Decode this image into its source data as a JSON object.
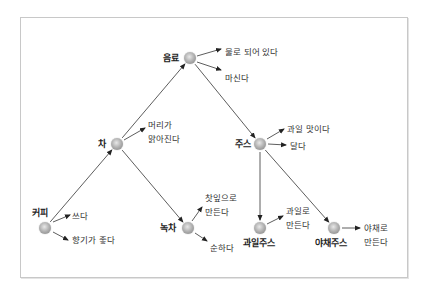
{
  "diagram": {
    "type": "concept-hierarchy",
    "nodes": [
      {
        "id": "beverage",
        "label": "음료",
        "x": 190,
        "y": 58,
        "label_x": 163,
        "label_y": 53
      },
      {
        "id": "tea",
        "label": "차",
        "x": 117,
        "y": 144,
        "label_x": 98,
        "label_y": 139
      },
      {
        "id": "coffee",
        "label": "커피",
        "x": 45,
        "y": 228,
        "label_x": 32,
        "label_y": 208
      },
      {
        "id": "green_tea",
        "label": "녹차",
        "x": 188,
        "y": 228,
        "label_x": 160,
        "label_y": 223
      },
      {
        "id": "juice",
        "label": "주스",
        "x": 260,
        "y": 144,
        "label_x": 235,
        "label_y": 139
      },
      {
        "id": "fruit_juice",
        "label": "과일주스",
        "x": 260,
        "y": 228,
        "label_x": 243,
        "label_y": 238
      },
      {
        "id": "veg_juice",
        "label": "야채주스",
        "x": 334,
        "y": 228,
        "label_x": 315,
        "label_y": 238
      }
    ],
    "edges": [
      {
        "from": "coffee",
        "to": "tea"
      },
      {
        "from": "tea",
        "to": "beverage"
      },
      {
        "from": "beverage",
        "to": "juice"
      },
      {
        "from": "tea",
        "to": "green_tea"
      },
      {
        "from": "juice",
        "to": "fruit_juice"
      },
      {
        "from": "juice",
        "to": "veg_juice"
      }
    ],
    "attributes": [
      {
        "node": "beverage",
        "text": "물로 되어 있다",
        "x": 225,
        "y": 45,
        "ax1": 197,
        "ay1": 56,
        "ax2": 221,
        "ay2": 49
      },
      {
        "node": "beverage",
        "text": "마신다",
        "x": 225,
        "y": 71,
        "ax1": 197,
        "ay1": 62,
        "ax2": 221,
        "ay2": 70
      },
      {
        "node": "tea",
        "text": "머리가\n맑아진다",
        "x": 148,
        "y": 118,
        "ax1": 124,
        "ay1": 140,
        "ax2": 145,
        "ay2": 128
      },
      {
        "node": "coffee",
        "text": "쓰다",
        "x": 72,
        "y": 209,
        "ax1": 53,
        "ay1": 222,
        "ax2": 70,
        "ay2": 215
      },
      {
        "node": "coffee",
        "text": "향기가 좋다",
        "x": 72,
        "y": 233,
        "ax1": 53,
        "ay1": 232,
        "ax2": 68,
        "ay2": 240
      },
      {
        "node": "green_tea",
        "text": "찻잎으로\n만든다",
        "x": 205,
        "y": 191,
        "ax1": 192,
        "ay1": 221,
        "ax2": 202,
        "ay2": 207
      },
      {
        "node": "green_tea",
        "text": "순하다",
        "x": 210,
        "y": 241,
        "ax1": 195,
        "ay1": 233,
        "ax2": 207,
        "ay2": 241
      },
      {
        "node": "juice",
        "text": "과일 맛이다",
        "x": 287,
        "y": 122,
        "ax1": 267,
        "ay1": 139,
        "ax2": 284,
        "ay2": 129
      },
      {
        "node": "juice",
        "text": "달다",
        "x": 290,
        "y": 139,
        "ax1": 268,
        "ay1": 144,
        "ax2": 286,
        "ay2": 145
      },
      {
        "node": "fruit_juice",
        "text": "과일로\n만든다",
        "x": 286,
        "y": 204,
        "ax1": 267,
        "ay1": 224,
        "ax2": 283,
        "ay2": 216
      },
      {
        "node": "veg_juice",
        "text": "야채로\n만든다",
        "x": 364,
        "y": 221,
        "ax1": 342,
        "ay1": 228,
        "ax2": 360,
        "ay2": 228
      }
    ]
  },
  "colors": {
    "edge": "#333333",
    "frame_border": "#c8c8c8",
    "node_fill": "#b4b4b4"
  }
}
